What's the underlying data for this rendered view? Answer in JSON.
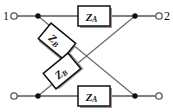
{
  "diagram": {
    "type": "electrical-schematic",
    "canvas": {
      "width": 173,
      "height": 112
    },
    "colors": {
      "background": "#ffffff",
      "wire": "#58585a",
      "diagonal_wire": "#6a6a6c",
      "node": "#111111",
      "box_fill": "#ffffff",
      "box_stroke": "#111111",
      "box_shadow": "#9a9a9c",
      "label": "#111111"
    },
    "terminals": [
      {
        "name": "terminal-1",
        "label": "1",
        "label_x": 6,
        "label_y": 16,
        "cx": 14,
        "cy": 16,
        "r": 3.2
      },
      {
        "name": "terminal-2",
        "label": "2",
        "label_x": 167,
        "label_y": 16,
        "cx": 159,
        "cy": 16,
        "r": 3.2
      },
      {
        "name": "terminal-1-prime",
        "label": "",
        "label_x": 6,
        "label_y": 96,
        "cx": 14,
        "cy": 96,
        "r": 3.2
      },
      {
        "name": "terminal-2-prime",
        "label": "",
        "label_x": 167,
        "label_y": 96,
        "cx": 159,
        "cy": 96,
        "r": 3.2
      }
    ],
    "nodes": [
      {
        "name": "node-top-left",
        "cx": 38,
        "cy": 16,
        "r": 2.6
      },
      {
        "name": "node-top-right",
        "cx": 135,
        "cy": 16,
        "r": 2.6
      },
      {
        "name": "node-bottom-left",
        "cx": 38,
        "cy": 96,
        "r": 2.6
      },
      {
        "name": "node-bottom-right",
        "cx": 135,
        "cy": 96,
        "r": 2.6
      }
    ],
    "wires": [
      {
        "name": "wire-top-left-lead",
        "x1": 17,
        "y1": 16,
        "x2": 38,
        "y2": 16
      },
      {
        "name": "wire-top-to-za",
        "x1": 38,
        "y1": 16,
        "x2": 78,
        "y2": 16
      },
      {
        "name": "wire-za-to-top-right",
        "x1": 110,
        "y1": 16,
        "x2": 135,
        "y2": 16
      },
      {
        "name": "wire-top-right-lead",
        "x1": 135,
        "y1": 16,
        "x2": 156,
        "y2": 16
      },
      {
        "name": "wire-bot-left-lead",
        "x1": 17,
        "y1": 96,
        "x2": 38,
        "y2": 96
      },
      {
        "name": "wire-bot-to-za",
        "x1": 38,
        "y1": 96,
        "x2": 78,
        "y2": 96
      },
      {
        "name": "wire-za-to-bot-right",
        "x1": 110,
        "y1": 96,
        "x2": 135,
        "y2": 96
      },
      {
        "name": "wire-bot-right-lead",
        "x1": 135,
        "y1": 96,
        "x2": 156,
        "y2": 96
      }
    ],
    "diagonals": [
      {
        "name": "diagonal-topleft-to-botright",
        "x1": 38,
        "y1": 16,
        "x2": 135,
        "y2": 96
      },
      {
        "name": "diagonal-botleft-to-topright",
        "x1": 38,
        "y1": 96,
        "x2": 135,
        "y2": 16
      }
    ],
    "components": [
      {
        "name": "impedance-za-top",
        "label": "Z",
        "subscript": "A",
        "x": 78,
        "y": 6,
        "width": 32,
        "height": 20,
        "rotation": 0,
        "cx": 94,
        "cy": 16
      },
      {
        "name": "impedance-za-bottom",
        "label": "Z",
        "subscript": "A",
        "x": 78,
        "y": 86,
        "width": 32,
        "height": 20,
        "rotation": 0,
        "cx": 94,
        "cy": 96
      },
      {
        "name": "impedance-zb-upper",
        "label": "Z",
        "subscript": "B",
        "x": 41,
        "y": 31,
        "width": 32,
        "height": 20,
        "rotation": 39.5,
        "cx": 57,
        "cy": 41
      },
      {
        "name": "impedance-zb-lower",
        "label": "Z",
        "subscript": "B",
        "x": 46,
        "y": 61,
        "width": 32,
        "height": 20,
        "rotation": -39.5,
        "cx": 62,
        "cy": 71
      }
    ]
  }
}
